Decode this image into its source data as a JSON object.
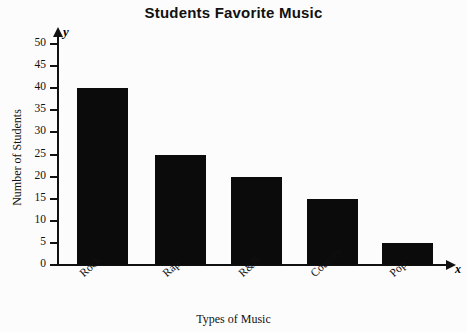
{
  "chart_data": {
    "type": "bar",
    "title": "Students Favorite Music",
    "xlabel": "Types of Music",
    "ylabel": "Number of Students",
    "categories": [
      "Rock",
      "Rap",
      "R&B",
      "Country",
      "Pop"
    ],
    "values": [
      40,
      25,
      20,
      15,
      5
    ],
    "ylim": [
      0,
      50
    ],
    "ytick_step": 5,
    "yticks": [
      0,
      5,
      10,
      15,
      20,
      25,
      30,
      35,
      40,
      45,
      50
    ],
    "ytick_labels": [
      "0",
      "5",
      "10",
      "15",
      "20",
      "25",
      "30",
      "35",
      "40",
      "45",
      "50"
    ],
    "grid": false,
    "legend": null,
    "bar_color": "#0b0b0b",
    "background_color": "#fcfcfc",
    "axis_color": "#111111",
    "x_axis_marker": "x",
    "y_axis_marker": "y",
    "series": [
      {
        "name": "Number of Students",
        "values": [
          40,
          25,
          20,
          15,
          5
        ]
      }
    ]
  }
}
